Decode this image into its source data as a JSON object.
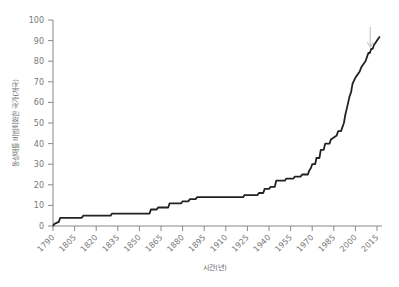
{
  "chart_data": {
    "type": "line",
    "title": "",
    "xlabel": "시간(년)",
    "ylabel": "동성애를 비범죄화한 국가(개국)",
    "xlim": [
      1790,
      2018
    ],
    "ylim": [
      0,
      100
    ],
    "x_ticks": [
      1790,
      1805,
      1820,
      1835,
      1850,
      1865,
      1880,
      1895,
      1910,
      1925,
      1940,
      1955,
      1970,
      1985,
      2000,
      2015
    ],
    "y_ticks": [
      0,
      10,
      20,
      30,
      40,
      50,
      60,
      70,
      80,
      90,
      100
    ],
    "grid": false,
    "legend": null,
    "series": [
      {
        "name": "비범죄화 국가 수",
        "step": true,
        "x": [
          1790,
          1791,
          1794,
          1795,
          1810,
          1811,
          1830,
          1831,
          1857,
          1858,
          1862,
          1863,
          1870,
          1871,
          1879,
          1880,
          1884,
          1885,
          1889,
          1890,
          1922,
          1923,
          1932,
          1933,
          1936,
          1937,
          1940,
          1941,
          1944,
          1945,
          1951,
          1952,
          1957,
          1958,
          1962,
          1963,
          1967,
          1968,
          1969,
          1970,
          1972,
          1973,
          1975,
          1976,
          1978,
          1979,
          1982,
          1983,
          1987,
          1988,
          1990,
          1991,
          1992,
          1993,
          1994,
          1995,
          1996,
          1997,
          1998,
          2000,
          2001,
          2002,
          2003,
          2004,
          2005,
          2006,
          2007,
          2008,
          2009,
          2010,
          2011,
          2012,
          2013,
          2014,
          2015,
          2016,
          2017
        ],
        "values": [
          0,
          1,
          2,
          4,
          4,
          5,
          5,
          6,
          6,
          8,
          8,
          9,
          9,
          11,
          11,
          12,
          12,
          13,
          13,
          14,
          14,
          15,
          15,
          16,
          16,
          18,
          18,
          19,
          19,
          22,
          22,
          23,
          23,
          24,
          24,
          25,
          25,
          27,
          28,
          30,
          30,
          33,
          33,
          37,
          37,
          40,
          40,
          42,
          44,
          46,
          46,
          48,
          50,
          54,
          57,
          60,
          63,
          65,
          69,
          72,
          73,
          74,
          75,
          77,
          78,
          79,
          80,
          82,
          84,
          84,
          86,
          86,
          88,
          89,
          90,
          91,
          92
        ]
      }
    ],
    "annotations": [
      {
        "type": "arrow",
        "x": 2011,
        "y_from": 100,
        "y_to": 87,
        "color": "#c8c8c8",
        "direction": "down"
      }
    ],
    "colors": {
      "line": "#222222",
      "axis": "#888888",
      "arrow": "#c8c8c8",
      "text": "#777777"
    }
  }
}
